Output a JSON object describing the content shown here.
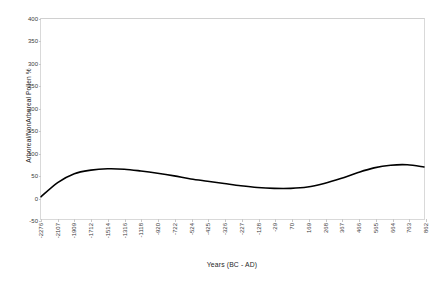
{
  "chart_data": {
    "type": "line",
    "title": "",
    "xlabel": "Years (BC - AD)",
    "ylabel": "Arboreal/NonArboreal Pollen %",
    "categories": [
      "-2276",
      "-2107",
      "-1909",
      "-1712",
      "-1514",
      "-1316",
      "-1118",
      "-920",
      "-722",
      "-524",
      "-425",
      "-326",
      "-227",
      "-128",
      "-29",
      "70",
      "169",
      "268",
      "367",
      "466",
      "565",
      "664",
      "763",
      "862"
    ],
    "values": [
      0,
      32,
      52,
      60,
      63,
      62,
      58,
      53,
      47,
      40,
      35,
      30,
      25,
      21,
      19,
      19,
      22,
      30,
      41,
      54,
      65,
      71,
      72,
      67
    ],
    "ytick_labels": [
      "400",
      "350",
      "300",
      "250",
      "200",
      "150",
      "100",
      "50",
      "0",
      "-50"
    ],
    "ytick_values": [
      400,
      350,
      300,
      250,
      200,
      150,
      100,
      50,
      0,
      -50
    ],
    "ylim": [
      -50,
      400
    ],
    "xlim_index": [
      0,
      23
    ],
    "grid": false,
    "legend": "none",
    "line_color": "#000000",
    "line_width": 1.6,
    "axis_color": "#d9d9d9",
    "text_color": "#3a3a3a",
    "background": "#ffffff"
  }
}
